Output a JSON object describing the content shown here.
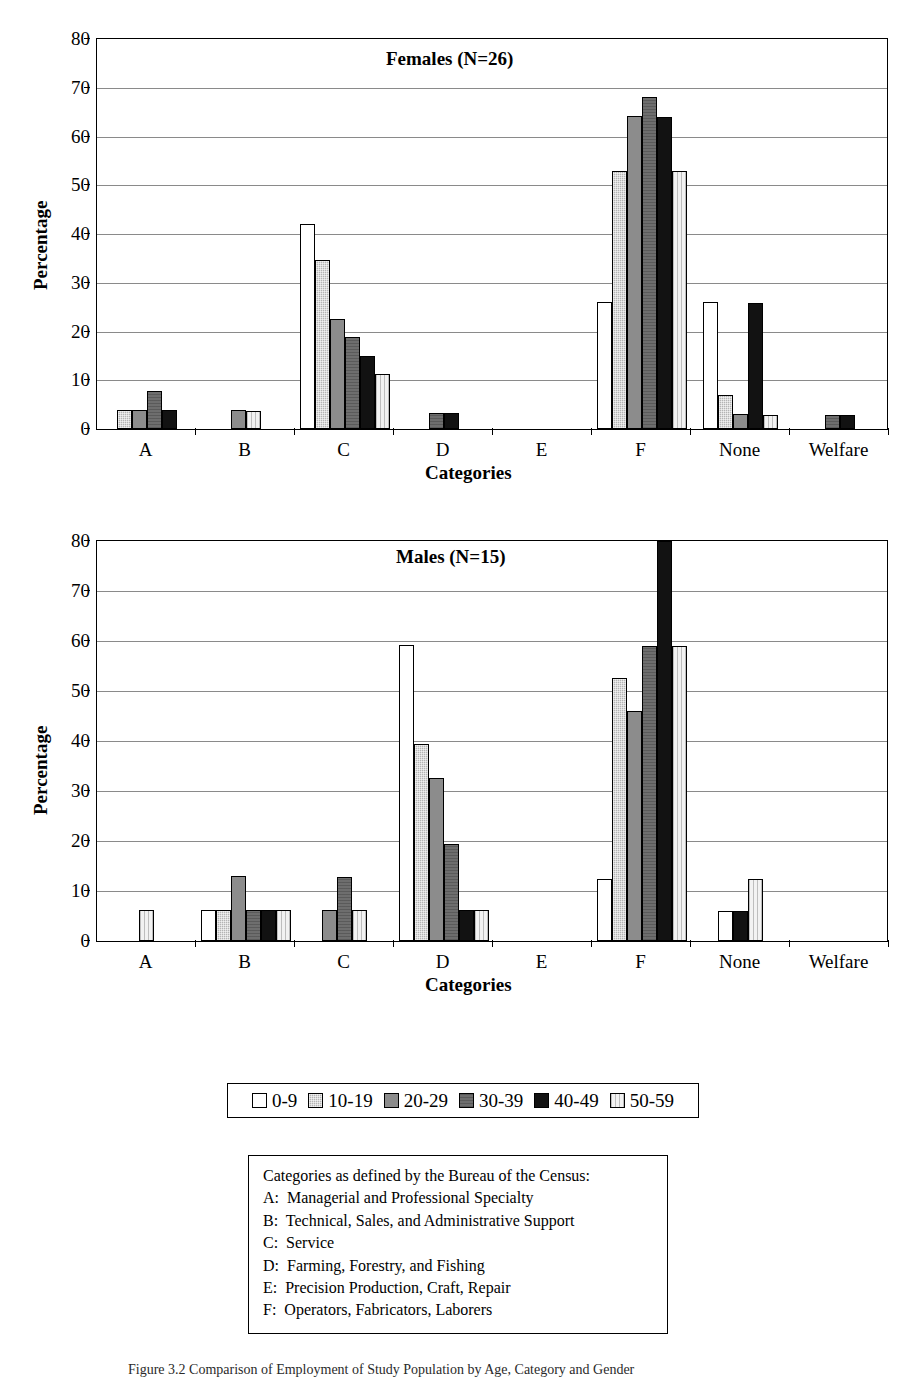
{
  "figure": {
    "ylabel": "Percentage",
    "xlabel": "Categories",
    "caption": "Figure 3.2   Comparison of Employment of Study Population by Age, Category and Gender"
  },
  "legend": {
    "items": [
      {
        "label": "0-9",
        "pattern": "pat-0-9"
      },
      {
        "label": "10-19",
        "pattern": "pat-10-19"
      },
      {
        "label": "20-29",
        "pattern": "pat-20-29"
      },
      {
        "label": "30-39",
        "pattern": "pat-30-39"
      },
      {
        "label": "40-49",
        "pattern": "pat-40-49"
      },
      {
        "label": "50-59",
        "pattern": "pat-50-59"
      }
    ]
  },
  "caption_box": {
    "lines": [
      "Categories as defined by the Bureau of the Census:",
      "A:  Managerial and Professional Specialty",
      "B:  Technical, Sales, and Administrative Support",
      "C:  Service",
      "D:  Farming, Forestry, and Fishing",
      "E:  Precision Production, Craft, Repair",
      "F:  Operators, Fabricators, Laborers"
    ]
  },
  "chart_data": [
    {
      "type": "bar",
      "id": "females",
      "title": "Females (N=26)",
      "xlabel": "Categories",
      "ylabel": "Percentage",
      "ylim": [
        0,
        80
      ],
      "yticks": [
        0,
        10,
        20,
        30,
        40,
        50,
        60,
        70,
        80
      ],
      "grid": true,
      "legend_position": "below-figure",
      "categories": [
        "A",
        "B",
        "C",
        "D",
        "E",
        "F",
        "None",
        "Welfare"
      ],
      "series": [
        {
          "name": "0-9",
          "values": [
            0,
            0,
            42,
            0,
            0,
            26,
            26,
            0
          ]
        },
        {
          "name": "10-19",
          "values": [
            3.8,
            0,
            34.6,
            0,
            0,
            53,
            6.9,
            0
          ]
        },
        {
          "name": "20-29",
          "values": [
            3.8,
            3.8,
            22.5,
            0,
            0,
            64.3,
            3,
            0
          ]
        },
        {
          "name": "30-39",
          "values": [
            7.7,
            0,
            18.8,
            3.3,
            0,
            68.2,
            0,
            2.8
          ]
        },
        {
          "name": "40-49",
          "values": [
            3.8,
            0,
            15,
            3.3,
            0,
            64,
            25.9,
            2.8
          ]
        },
        {
          "name": "50-59",
          "values": [
            0,
            3.6,
            11.2,
            0,
            0,
            53,
            2.9,
            0
          ]
        }
      ]
    },
    {
      "type": "bar",
      "id": "males",
      "title": "Males (N=15)",
      "xlabel": "Categories",
      "ylabel": "Percentage",
      "ylim": [
        0,
        80
      ],
      "yticks": [
        0,
        10,
        20,
        30,
        40,
        50,
        60,
        70,
        80
      ],
      "grid": true,
      "legend_position": "below-figure",
      "categories": [
        "A",
        "B",
        "C",
        "D",
        "E",
        "F",
        "None",
        "Welfare"
      ],
      "series": [
        {
          "name": "0-9",
          "values": [
            0,
            6.2,
            0,
            59.2,
            0,
            12.3,
            5.9,
            0
          ]
        },
        {
          "name": "10-19",
          "values": [
            0,
            6.2,
            0,
            39.4,
            0,
            52.5,
            0,
            0
          ]
        },
        {
          "name": "20-29",
          "values": [
            0,
            13,
            6.2,
            32.6,
            0,
            46,
            0,
            0
          ]
        },
        {
          "name": "30-39",
          "values": [
            0,
            6.2,
            12.8,
            19.3,
            0,
            59,
            0,
            0
          ]
        },
        {
          "name": "40-49",
          "values": [
            0,
            6.2,
            0,
            6.1,
            0,
            80,
            5.9,
            0
          ]
        },
        {
          "name": "50-59",
          "values": [
            6.2,
            6.2,
            6.2,
            6.1,
            0,
            59,
            12.3,
            0
          ]
        }
      ]
    }
  ]
}
